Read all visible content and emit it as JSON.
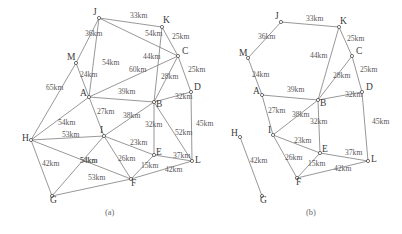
{
  "figure": {
    "type": "graph-diagram",
    "captions": [
      {
        "id": "cap-a",
        "text": "(a)",
        "x": 105,
        "y": 215
      },
      {
        "id": "cap-b",
        "text": "(b)",
        "x": 306,
        "y": 215
      }
    ]
  },
  "graph_a": {
    "caption": "(a)",
    "nodes": [
      {
        "id": "J",
        "label": "J",
        "x": 99,
        "y": 18,
        "lx": 93,
        "ly": 15
      },
      {
        "id": "K",
        "label": "K",
        "x": 162,
        "y": 27,
        "lx": 163,
        "ly": 23
      },
      {
        "id": "C",
        "label": "C",
        "x": 178,
        "y": 56,
        "lx": 182,
        "ly": 54
      },
      {
        "id": "M",
        "label": "M",
        "x": 76,
        "y": 63,
        "lx": 67,
        "ly": 60
      },
      {
        "id": "A",
        "label": "A",
        "x": 89,
        "y": 97,
        "lx": 80,
        "ly": 96
      },
      {
        "id": "B",
        "label": "B",
        "x": 154,
        "y": 102,
        "lx": 156,
        "ly": 107
      },
      {
        "id": "D",
        "label": "D",
        "x": 191,
        "y": 92,
        "lx": 194,
        "ly": 90
      },
      {
        "id": "H",
        "label": "H",
        "x": 31,
        "y": 140,
        "lx": 22,
        "ly": 141
      },
      {
        "id": "I",
        "label": "I",
        "x": 104,
        "y": 136,
        "lx": 100,
        "ly": 133
      },
      {
        "id": "E",
        "label": "E",
        "x": 154,
        "y": 155,
        "lx": 156,
        "ly": 155
      },
      {
        "id": "L",
        "label": "L",
        "x": 192,
        "y": 161,
        "lx": 195,
        "ly": 163
      },
      {
        "id": "F",
        "label": "F",
        "x": 131,
        "y": 179,
        "lx": 131,
        "ly": 186
      },
      {
        "id": "G",
        "label": "G",
        "x": 52,
        "y": 196,
        "lx": 50,
        "ly": 203
      }
    ],
    "edges": [
      {
        "from": "J",
        "to": "K",
        "weight": "33km",
        "lx": 130,
        "ly": 18
      },
      {
        "from": "J",
        "to": "C",
        "weight": "54km",
        "lx": 145,
        "ly": 36
      },
      {
        "from": "J",
        "to": "M",
        "weight": "36km",
        "lx": 85,
        "ly": 36
      },
      {
        "from": "J",
        "to": "A",
        "weight": "54km",
        "lx": 102,
        "ly": 65
      },
      {
        "from": "K",
        "to": "C",
        "weight": "25km",
        "lx": 172,
        "ly": 39
      },
      {
        "from": "K",
        "to": "B",
        "weight": "44km",
        "lx": 143,
        "ly": 59
      },
      {
        "from": "M",
        "to": "A",
        "weight": "24km",
        "lx": 80,
        "ly": 77
      },
      {
        "from": "M",
        "to": "H",
        "weight": "65km",
        "lx": 46,
        "ly": 90
      },
      {
        "from": "C",
        "to": "A",
        "weight": "60km",
        "lx": 129,
        "ly": 72
      },
      {
        "from": "C",
        "to": "B",
        "weight": "28km",
        "lx": 161,
        "ly": 79
      },
      {
        "from": "C",
        "to": "D",
        "weight": "25km",
        "lx": 188,
        "ly": 72
      },
      {
        "from": "A",
        "to": "B",
        "weight": "39km",
        "lx": 118,
        "ly": 94
      },
      {
        "from": "A",
        "to": "I",
        "weight": "27km",
        "lx": 97,
        "ly": 114
      },
      {
        "from": "A",
        "to": "H",
        "weight": "54km",
        "lx": 58,
        "ly": 125
      },
      {
        "from": "B",
        "to": "D",
        "weight": "32km",
        "lx": 175,
        "ly": 99
      },
      {
        "from": "B",
        "to": "I",
        "weight": "38km",
        "lx": 123,
        "ly": 118
      },
      {
        "from": "B",
        "to": "E",
        "weight": "32km",
        "lx": 145,
        "ly": 127
      },
      {
        "from": "B",
        "to": "L",
        "weight": "52km",
        "lx": 175,
        "ly": 135
      },
      {
        "from": "D",
        "to": "L",
        "weight": "45km",
        "lx": 196,
        "ly": 126
      },
      {
        "from": "H",
        "to": "I",
        "weight": "53km",
        "lx": 62,
        "ly": 137
      },
      {
        "from": "H",
        "to": "G",
        "weight": "42km",
        "lx": 42,
        "ly": 166
      },
      {
        "from": "H",
        "to": "F",
        "weight": "54km",
        "lx": 80,
        "ly": 163
      },
      {
        "from": "I",
        "to": "E",
        "weight": "23km",
        "lx": 130,
        "ly": 145
      },
      {
        "from": "I",
        "to": "F",
        "weight": "26km",
        "lx": 118,
        "ly": 161
      },
      {
        "from": "I",
        "to": "G",
        "weight": "54km",
        "lx": 80,
        "ly": 163
      },
      {
        "from": "E",
        "to": "F",
        "weight": "15km",
        "lx": 141,
        "ly": 168
      },
      {
        "from": "E",
        "to": "L",
        "weight": "37km",
        "lx": 173,
        "ly": 158
      },
      {
        "from": "F",
        "to": "L",
        "weight": "42km",
        "lx": 165,
        "ly": 172
      },
      {
        "from": "F",
        "to": "G",
        "weight": "53km",
        "lx": 88,
        "ly": 180
      }
    ]
  },
  "graph_b": {
    "caption": "(b)",
    "nodes": [
      {
        "id": "J",
        "label": "J",
        "x": 281,
        "y": 22,
        "lx": 275,
        "ly": 19
      },
      {
        "id": "K",
        "label": "K",
        "x": 339,
        "y": 27,
        "lx": 340,
        "ly": 24
      },
      {
        "id": "C",
        "label": "C",
        "x": 352,
        "y": 56,
        "lx": 356,
        "ly": 54
      },
      {
        "id": "M",
        "label": "M",
        "x": 248,
        "y": 58,
        "lx": 239,
        "ly": 56
      },
      {
        "id": "A",
        "label": "A",
        "x": 262,
        "y": 95,
        "lx": 253,
        "ly": 94
      },
      {
        "id": "B",
        "label": "B",
        "x": 318,
        "y": 100,
        "lx": 320,
        "ly": 106
      },
      {
        "id": "D",
        "label": "D",
        "x": 362,
        "y": 92,
        "lx": 366,
        "ly": 90
      },
      {
        "id": "H",
        "label": "H",
        "x": 240,
        "y": 137,
        "lx": 231,
        "ly": 136
      },
      {
        "id": "I",
        "label": "I",
        "x": 273,
        "y": 135,
        "lx": 268,
        "ly": 133
      },
      {
        "id": "E",
        "label": "E",
        "x": 320,
        "y": 153,
        "lx": 322,
        "ly": 152
      },
      {
        "id": "L",
        "label": "L",
        "x": 368,
        "y": 161,
        "lx": 371,
        "ly": 162
      },
      {
        "id": "F",
        "label": "F",
        "x": 297,
        "y": 178,
        "lx": 296,
        "ly": 185
      },
      {
        "id": "G",
        "label": "G",
        "x": 262,
        "y": 196,
        "lx": 260,
        "ly": 203
      }
    ],
    "edges": [
      {
        "from": "J",
        "to": "K",
        "weight": "33km",
        "lx": 306,
        "ly": 21
      },
      {
        "from": "J",
        "to": "M",
        "weight": "36km",
        "lx": 258,
        "ly": 39
      },
      {
        "from": "K",
        "to": "C",
        "weight": "25km",
        "lx": 347,
        "ly": 41
      },
      {
        "from": "K",
        "to": "B",
        "weight": "44km",
        "lx": 310,
        "ly": 58
      },
      {
        "from": "M",
        "to": "A",
        "weight": "24km",
        "lx": 252,
        "ly": 77
      },
      {
        "from": "C",
        "to": "B",
        "weight": "28km",
        "lx": 333,
        "ly": 78
      },
      {
        "from": "C",
        "to": "D",
        "weight": "25km",
        "lx": 360,
        "ly": 72
      },
      {
        "from": "A",
        "to": "B",
        "weight": "39km",
        "lx": 287,
        "ly": 92
      },
      {
        "from": "A",
        "to": "I",
        "weight": "27km",
        "lx": 268,
        "ly": 113
      },
      {
        "from": "B",
        "to": "D",
        "weight": "32km",
        "lx": 345,
        "ly": 97
      },
      {
        "from": "B",
        "to": "I",
        "weight": "38km",
        "lx": 292,
        "ly": 117
      },
      {
        "from": "B",
        "to": "E",
        "weight": "32km",
        "lx": 310,
        "ly": 124
      },
      {
        "from": "D",
        "to": "L",
        "weight": "45km",
        "lx": 372,
        "ly": 124
      },
      {
        "from": "H",
        "to": "G",
        "weight": "42km",
        "lx": 250,
        "ly": 163
      },
      {
        "from": "I",
        "to": "E",
        "weight": "23km",
        "lx": 294,
        "ly": 143
      },
      {
        "from": "I",
        "to": "F",
        "weight": "26km",
        "lx": 285,
        "ly": 160
      },
      {
        "from": "E",
        "to": "F",
        "weight": "15km",
        "lx": 308,
        "ly": 166
      },
      {
        "from": "E",
        "to": "L",
        "weight": "37km",
        "lx": 345,
        "ly": 155
      },
      {
        "from": "F",
        "to": "L",
        "weight": "42km",
        "lx": 334,
        "ly": 171
      }
    ]
  }
}
